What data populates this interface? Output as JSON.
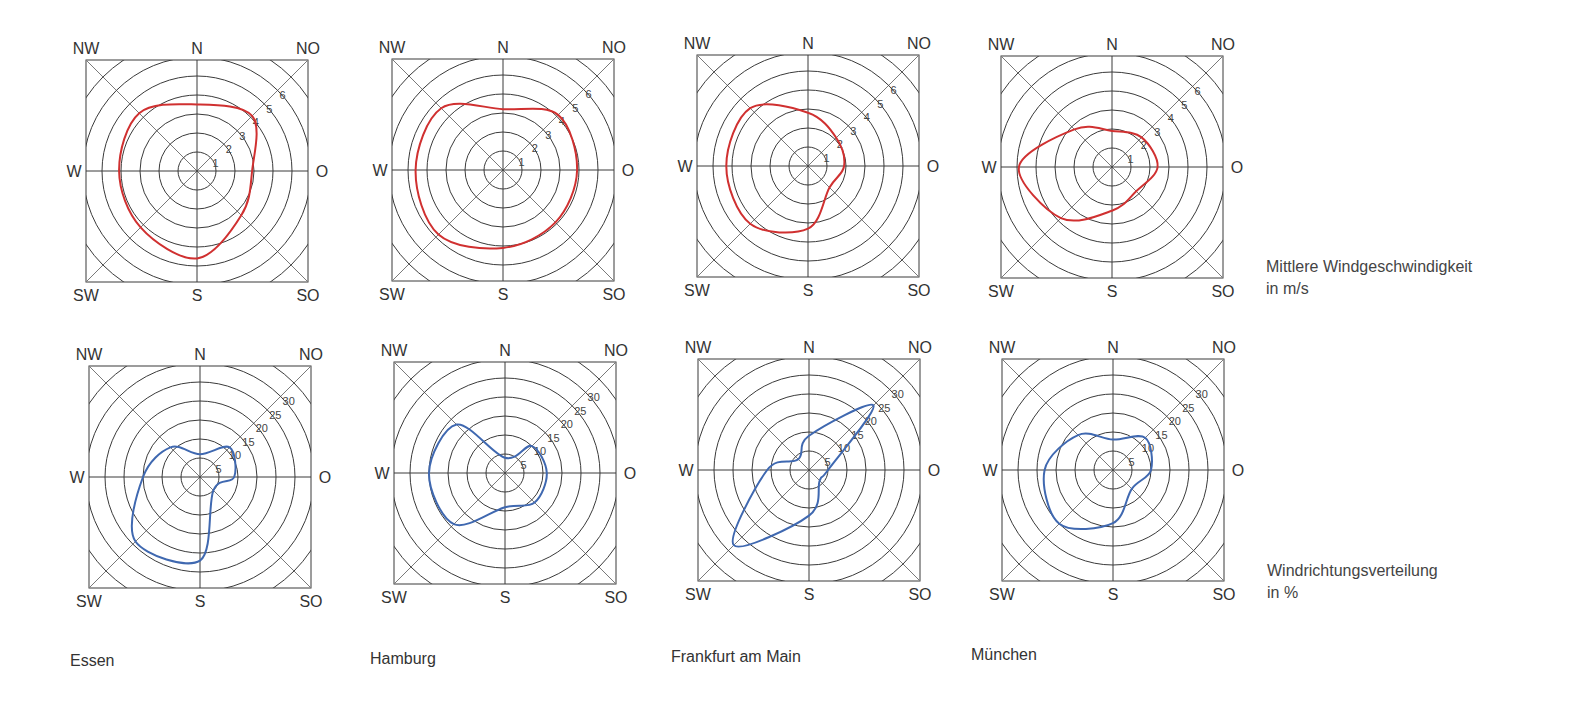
{
  "legend": {
    "speed_line1": "Mittlere Windgeschwindigkeit",
    "speed_line2": "in m/s",
    "direction_line1": "Windrichtungsverteilung",
    "direction_line2": "in %"
  },
  "cities": [
    "Essen",
    "Hamburg",
    "Frankfurt am Main",
    "München"
  ],
  "directions": [
    "N",
    "NO",
    "O",
    "SO",
    "S",
    "SW",
    "W",
    "NW"
  ],
  "speed_ticks": [
    "1",
    "2",
    "3",
    "4",
    "5",
    "6"
  ],
  "direction_ticks": [
    "5",
    "10",
    "15",
    "20",
    "25",
    "30"
  ],
  "colors": {
    "speed": "#d03030",
    "direction": "#3f68b0",
    "grid": "#3a3a3a"
  },
  "chart_data": [
    {
      "type": "radar",
      "title": "Essen",
      "subtitle": "Mittlere Windgeschwindigkeit in m/s",
      "categories": [
        "N",
        "NO",
        "O",
        "SO",
        "S",
        "SW",
        "W",
        "NW"
      ],
      "values": [
        3.5,
        4.1,
        2.9,
        3.3,
        4.6,
        4.2,
        4.1,
        4.3
      ],
      "rlim": [
        0,
        6
      ]
    },
    {
      "type": "radar",
      "title": "Hamburg",
      "subtitle": "Mittlere Windgeschwindigkeit in m/s",
      "categories": [
        "N",
        "NO",
        "O",
        "SO",
        "S",
        "SW",
        "W",
        "NW"
      ],
      "values": [
        3.2,
        4.1,
        3.9,
        3.9,
        4.1,
        4.8,
        4.6,
        4.6
      ],
      "rlim": [
        0,
        6
      ]
    },
    {
      "type": "radar",
      "title": "Frankfurt am Main",
      "subtitle": "Mittlere Windgeschwindigkeit in m/s",
      "categories": [
        "N",
        "NO",
        "O",
        "SO",
        "S",
        "SW",
        "W",
        "NW"
      ],
      "values": [
        2.8,
        2.1,
        1.9,
        1.6,
        3.3,
        4.3,
        4.3,
        4.3
      ],
      "rlim": [
        0,
        6
      ]
    },
    {
      "type": "radar",
      "title": "München",
      "subtitle": "Mittlere Windgeschwindigkeit in m/s",
      "categories": [
        "N",
        "NO",
        "O",
        "SO",
        "S",
        "SW",
        "W",
        "NW"
      ],
      "values": [
        1.9,
        2.2,
        2.4,
        1.8,
        2.3,
        3.8,
        4.9,
        2.8
      ],
      "rlim": [
        0,
        6
      ]
    },
    {
      "type": "radar",
      "title": "Essen",
      "subtitle": "Windrichtungsverteilung in %",
      "categories": [
        "N",
        "NO",
        "O",
        "SO",
        "S",
        "SW",
        "W",
        "NW"
      ],
      "values": [
        6,
        11,
        9,
        5,
        22,
        24,
        15,
        11
      ],
      "rlim": [
        0,
        30
      ]
    },
    {
      "type": "radar",
      "title": "Hamburg",
      "subtitle": "Windrichtungsverteilung in %",
      "categories": [
        "N",
        "NO",
        "O",
        "SO",
        "S",
        "SW",
        "W",
        "NW"
      ],
      "values": [
        4,
        10,
        11,
        11,
        9,
        19,
        20,
        18
      ],
      "rlim": [
        0,
        30
      ]
    },
    {
      "type": "radar",
      "title": "Frankfurt am Main",
      "subtitle": "Windrichtungsverteilung in %",
      "categories": [
        "N",
        "NO",
        "O",
        "SO",
        "S",
        "SW",
        "W",
        "NW"
      ],
      "values": [
        9,
        24,
        5,
        4,
        12,
        28,
        11,
        4
      ],
      "rlim": [
        0,
        30
      ]
    },
    {
      "type": "radar",
      "title": "München",
      "subtitle": "Windrichtungsverteilung in %",
      "categories": [
        "N",
        "NO",
        "O",
        "SO",
        "S",
        "SW",
        "W",
        "NW"
      ],
      "values": [
        8,
        12,
        10,
        7,
        14,
        20,
        18,
        13
      ],
      "rlim": [
        0,
        30
      ]
    }
  ]
}
